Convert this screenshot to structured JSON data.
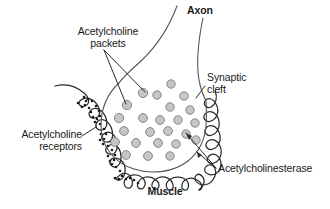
{
  "figure": {
    "background_color": "#ffffff",
    "line_color": "#2b2b2b",
    "vesicle_fill": "#c6c6c6",
    "vesicle_stroke": "#7d7d7d",
    "receptor_color": "#1a1a1a",
    "text_color": "#1a1a1a"
  },
  "labels": {
    "acetylcholine_packets": "Acetylcholine\npackets",
    "axon": "Axon",
    "synaptic_cleft": "Synaptic\ncleft",
    "acetylcholine_receptors": "Acetylcholine\nreceptors",
    "acetylcholinesterase": "Acetylcholinesterase",
    "muscle": "Muscle"
  },
  "structures": {
    "axon_terminal": "axon-terminal-bulb",
    "axon_tube": "axon-tube",
    "muscle_membrane": "muscle-membrane-folds",
    "vesicles_count": 24,
    "receptor_dot_count": 38
  },
  "vesicles": [
    {
      "cx": 171,
      "cy": 84,
      "r": 4.2
    },
    {
      "cx": 157,
      "cy": 95,
      "r": 4.2
    },
    {
      "cx": 184,
      "cy": 96,
      "r": 4.2
    },
    {
      "cx": 143,
      "cy": 93,
      "r": 4.6
    },
    {
      "cx": 127,
      "cy": 105,
      "r": 4.6
    },
    {
      "cx": 170,
      "cy": 107,
      "r": 4.2
    },
    {
      "cx": 190,
      "cy": 110,
      "r": 4.2
    },
    {
      "cx": 119,
      "cy": 118,
      "r": 4.6
    },
    {
      "cx": 143,
      "cy": 118,
      "r": 4.4
    },
    {
      "cx": 160,
      "cy": 120,
      "r": 4.4
    },
    {
      "cx": 178,
      "cy": 120,
      "r": 4.2
    },
    {
      "cx": 195,
      "cy": 123,
      "r": 4.2
    },
    {
      "cx": 124,
      "cy": 131,
      "r": 4.4
    },
    {
      "cx": 150,
      "cy": 132,
      "r": 4.4
    },
    {
      "cx": 168,
      "cy": 131,
      "r": 4.4
    },
    {
      "cx": 186,
      "cy": 134,
      "r": 4.2
    },
    {
      "cx": 115,
      "cy": 142,
      "r": 4.4
    },
    {
      "cx": 136,
      "cy": 143,
      "r": 4.4
    },
    {
      "cx": 158,
      "cy": 143,
      "r": 4.4
    },
    {
      "cx": 176,
      "cy": 144,
      "r": 4.2
    },
    {
      "cx": 196,
      "cy": 140,
      "r": 4.2
    },
    {
      "cx": 126,
      "cy": 155,
      "r": 4.4
    },
    {
      "cx": 148,
      "cy": 156,
      "r": 4.4
    },
    {
      "cx": 170,
      "cy": 156,
      "r": 4.2
    }
  ],
  "leader_lines": {
    "packets": [
      {
        "x1": 104,
        "y1": 50,
        "x2": 145,
        "y2": 92
      },
      {
        "x1": 104,
        "y1": 50,
        "x2": 126,
        "y2": 104
      }
    ],
    "synaptic_cleft": [
      {
        "x1": 205,
        "y1": 86,
        "x2": 196,
        "y2": 98
      }
    ],
    "receptors": [
      {
        "x1": 82,
        "y1": 136,
        "x2": 96,
        "y2": 127
      }
    ],
    "acetylcholinesterase": [
      {
        "x1": 216,
        "y1": 168,
        "x2": 186,
        "y2": 133
      },
      {
        "x1": 216,
        "y1": 168,
        "x2": 196,
        "y2": 151
      }
    ]
  }
}
